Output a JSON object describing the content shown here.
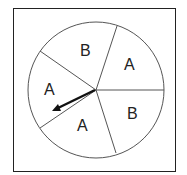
{
  "spinner": {
    "sections": [
      {
        "label": "B",
        "x": 80,
        "y": 56
      },
      {
        "label": "A",
        "x": 128,
        "y": 70
      },
      {
        "label": "B",
        "x": 131,
        "y": 119
      },
      {
        "label": "A",
        "x": 82,
        "y": 131
      },
      {
        "label": "A",
        "x": 49,
        "y": 95
      }
    ],
    "colors": {
      "line": "#555555",
      "arrow": "#111111",
      "border": "#222222"
    }
  }
}
